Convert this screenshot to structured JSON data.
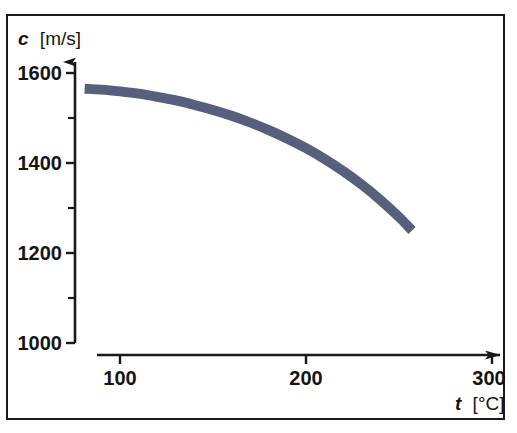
{
  "chart_data": {
    "type": "line",
    "title": "",
    "subtitle": "",
    "xlabel_symbol": "t",
    "xlabel_unit": "[°C]",
    "xlabel": "t [°C]",
    "ylabel_symbol": "c",
    "ylabel_unit": "[m/s]",
    "ylabel": "c [m/s]",
    "xlim": [
      80,
      305
    ],
    "ylim": [
      1000,
      1650
    ],
    "x_ticks_major": [
      100,
      200,
      300
    ],
    "x_tick_labels": [
      "100",
      "200",
      "300"
    ],
    "y_ticks_major": [
      1000,
      1200,
      1400,
      1600
    ],
    "y_tick_labels": [
      "1000",
      "1200",
      "1400",
      "1600"
    ],
    "y_ticks_minor": [
      1100,
      1300,
      1500
    ],
    "grid": false,
    "legend": null,
    "series": [
      {
        "name": "speed of sound in water vs temperature",
        "color": "#565f7c",
        "line_width_units": 22,
        "x": [
          81,
          90,
          100,
          110,
          120,
          130,
          140,
          150,
          160,
          170,
          180,
          190,
          200,
          210,
          220,
          230,
          240,
          250,
          257
        ],
        "y": [
          1565,
          1563,
          1559,
          1554,
          1547,
          1539,
          1529,
          1518,
          1505,
          1490,
          1473,
          1454,
          1433,
          1409,
          1382,
          1352,
          1318,
          1280,
          1250
        ]
      }
    ],
    "annotations": []
  },
  "axes": {
    "y_axis_name": "speed-of-sound-axis",
    "x_axis_name": "temperature-axis",
    "arrow_heads": true
  },
  "colors": {
    "curve": "#565f7c",
    "axis": "#1a1a1a",
    "frame": "#1a1a1a",
    "background": "#ffffff"
  }
}
